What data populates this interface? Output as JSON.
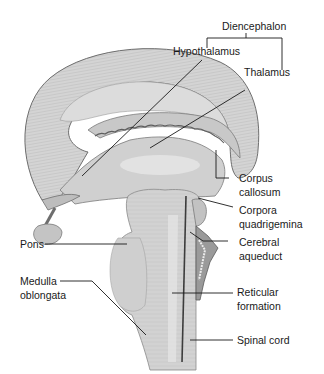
{
  "diagram": {
    "labels": {
      "diencephalon": "Diencephalon",
      "hypothalamus": "Hypothalamus",
      "thalamus": "Thalamus",
      "corpus_callosum_1": "Corpus",
      "corpus_callosum_2": "callosum",
      "corpora_quadrigemina_1": "Corpora",
      "corpora_quadrigemina_2": "quadrigemina",
      "cerebral_aqueduct_1": "Cerebral",
      "cerebral_aqueduct_2": "aqueduct",
      "pons": "Pons",
      "medulla_1": "Medulla",
      "medulla_2": "oblongata",
      "reticular_1": "Reticular",
      "reticular_2": "formation",
      "spinal_cord": "Spinal cord"
    },
    "colors": {
      "tissue_light": "#d9d9d9",
      "tissue_mid": "#bdbdbd",
      "tissue_dark": "#8c8c8c",
      "outline": "#6e6e6e",
      "leader_line": "#1a1a1a"
    }
  }
}
